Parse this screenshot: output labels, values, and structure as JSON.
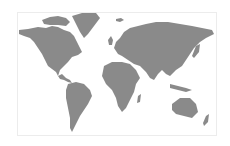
{
  "map": {
    "type": "world-map",
    "land_color": "#8a8a8a",
    "background_color": "#ffffff",
    "border_color": "#ececec",
    "regions": [
      "north-america",
      "greenland",
      "south-america",
      "europe",
      "africa",
      "asia",
      "australia",
      "new-zealand",
      "japan",
      "indonesia",
      "uk",
      "iceland",
      "madagascar"
    ]
  }
}
